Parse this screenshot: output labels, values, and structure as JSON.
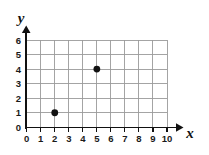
{
  "chart_data": {
    "type": "scatter",
    "title": "",
    "xlabel": "x",
    "ylabel": "y",
    "xlim": [
      0,
      10
    ],
    "ylim": [
      0,
      6
    ],
    "grid": true,
    "legend": false,
    "x_ticks": [
      "0",
      "1",
      "2",
      "3",
      "4",
      "5",
      "6",
      "7",
      "8",
      "9",
      "10"
    ],
    "y_ticks": [
      "0",
      "1",
      "2",
      "3",
      "4",
      "5",
      "6"
    ],
    "points": [
      {
        "label": "point-2-1",
        "x": 2,
        "y": 1
      },
      {
        "label": "point-5-4",
        "x": 5,
        "y": 4
      }
    ],
    "colors": {
      "point": "#111111",
      "grid": "#9a9a9a",
      "axis": "#111111",
      "background": "#ffffff"
    }
  },
  "figure": {
    "x_axis_label": "x",
    "y_axis_label": "y",
    "origin_label": "0"
  }
}
